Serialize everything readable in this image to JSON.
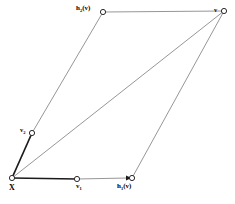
{
  "diagram": {
    "type": "geometric-lattice-parallelogram",
    "background_color": "#ffffff",
    "line_color_thin": "#8a8a8a",
    "line_color_bold": "#1a1a1a",
    "node_fill": "#ffffff",
    "node_stroke": "#2a2a2a",
    "labels": {
      "origin": "X",
      "h2v_base": "h",
      "h2v_sub": "2",
      "h2v_arg": "(v)",
      "h1v_base": "h",
      "h1v_sub": "1",
      "h1v_arg": "(v)",
      "v1_base": "v",
      "v1_sub": "1",
      "v2_base": "v",
      "v2_sub": "2",
      "v_apex": "v"
    },
    "nodes": [
      {
        "name": "origin",
        "label": "X",
        "x": 12,
        "y": 178
      },
      {
        "name": "v1",
        "label": "v1",
        "x": 77,
        "y": 179
      },
      {
        "name": "h1v",
        "label": "h1(v)",
        "x": 132,
        "y": 178
      },
      {
        "name": "v2",
        "label": "v2",
        "x": 32,
        "y": 133
      },
      {
        "name": "h2v",
        "label": "h2(v)",
        "x": 103,
        "y": 12
      },
      {
        "name": "v_apex",
        "label": "v",
        "x": 224,
        "y": 11
      }
    ],
    "edges": [
      {
        "name": "origin-to-v1",
        "from": "origin",
        "to": "v1",
        "weight": "bold"
      },
      {
        "name": "v1-to-h1v",
        "from": "v1",
        "to": "h1v",
        "weight": "thin",
        "arrow": true
      },
      {
        "name": "origin-to-v2",
        "from": "origin",
        "to": "v2",
        "weight": "bold"
      },
      {
        "name": "v2-to-h2v",
        "from": "v2",
        "to": "h2v",
        "weight": "thin"
      },
      {
        "name": "h2v-to-apex",
        "from": "h2v",
        "to": "v_apex",
        "weight": "thin"
      },
      {
        "name": "h1v-to-apex",
        "from": "h1v",
        "to": "v_apex",
        "weight": "thin"
      },
      {
        "name": "origin-to-apex",
        "from": "origin",
        "to": "v_apex",
        "weight": "thin"
      }
    ]
  }
}
